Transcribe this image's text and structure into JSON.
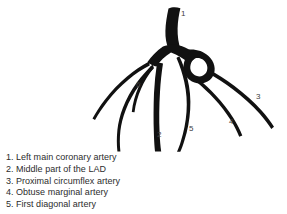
{
  "figure": {
    "type": "coronary-angiogram-line-drawing",
    "ink_color": "#111111",
    "background_color": "#ffffff",
    "label_color": "#3d3d3d",
    "markers": [
      {
        "id": "1",
        "text": "1",
        "x": 181,
        "y": 16
      },
      {
        "id": "2",
        "text": "2",
        "x": 157,
        "y": 137
      },
      {
        "id": "3",
        "text": "3",
        "x": 256,
        "y": 99
      },
      {
        "id": "4",
        "text": "4",
        "x": 229,
        "y": 124
      },
      {
        "id": "5",
        "text": "5",
        "x": 189,
        "y": 131
      },
      {
        "id": "6",
        "text": "6",
        "x": 136,
        "y": 87
      }
    ]
  },
  "caption": {
    "entries": [
      {
        "num": "1.",
        "text": "Left main coronary artery"
      },
      {
        "num": "2.",
        "text": "Middle part of the LAD"
      },
      {
        "num": "3.",
        "text": "Proximal circumflex artery"
      },
      {
        "num": "4.",
        "text": "Obtuse marginal artery"
      },
      {
        "num": "5.",
        "text": "First diagonal artery"
      }
    ]
  }
}
